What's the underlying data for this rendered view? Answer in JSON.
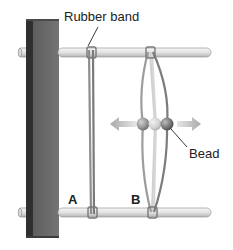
{
  "diagram": {
    "labels": {
      "rubber_band": "Rubber band",
      "bead": "Bead",
      "band_a": "A",
      "band_b": "B"
    },
    "colors": {
      "post_front": "#6b6b6b",
      "post_side": "#3a3a3a",
      "rod": "#e6e6e6",
      "rod_outline": "#9a9a9a",
      "band": "#8c8c8c",
      "bead_dark": "#6e6e6e",
      "bead_light": "#c8c8c8",
      "arrow": "#bdbdbd",
      "text": "#222222"
    },
    "elements": {
      "post": "wooden-post",
      "rods": [
        "top-rod",
        "bottom-rod"
      ],
      "bands": [
        "band-a",
        "band-b"
      ],
      "beads": [
        "bead-left-position",
        "bead-center-position",
        "bead-right-position"
      ],
      "arrows": [
        "arrow-left",
        "arrow-right"
      ]
    }
  }
}
